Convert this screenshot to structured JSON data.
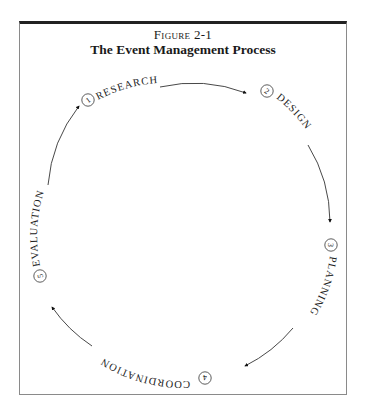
{
  "figure": {
    "number": "Figure 2-1",
    "title": "The Event Management Process"
  },
  "cycle": {
    "direction": "clockwise",
    "steps": [
      {
        "number": "1",
        "label": "RESEARCH"
      },
      {
        "number": "2",
        "label": "DESIGN"
      },
      {
        "number": "3",
        "label": "PLANNING"
      },
      {
        "number": "4",
        "label": "COORDINATION"
      },
      {
        "number": "5",
        "label": "EVALUATION"
      }
    ]
  },
  "colors": {
    "ink": "#222222",
    "frame": "#8a8a8a",
    "background": "#ffffff"
  }
}
